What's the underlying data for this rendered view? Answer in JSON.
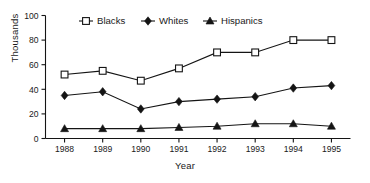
{
  "chart_data": {
    "type": "line",
    "title": "",
    "xlabel": "Year",
    "ylabel": "Thousands",
    "categories": [
      "1988",
      "1989",
      "1990",
      "1991",
      "1992",
      "1993",
      "1994",
      "1995"
    ],
    "x": [
      1988,
      1989,
      1990,
      1991,
      1992,
      1993,
      1994,
      1995
    ],
    "ylim": [
      0,
      100
    ],
    "yticks": [
      0,
      20,
      40,
      60,
      80,
      100
    ],
    "ytick_labels": [
      "0",
      "20",
      "40",
      "60",
      "80",
      "100"
    ],
    "grid": false,
    "legend_position": "top-center",
    "series": [
      {
        "name": "Blacks",
        "marker": "open-square",
        "color": "#141414",
        "values": [
          52,
          55,
          47,
          57,
          70,
          70,
          80,
          80
        ]
      },
      {
        "name": "Whites",
        "marker": "filled-diamond",
        "color": "#141414",
        "values": [
          35,
          38,
          24,
          30,
          32,
          34,
          41,
          43
        ]
      },
      {
        "name": "Hispanics",
        "marker": "filled-triangle",
        "color": "#141414",
        "values": [
          8,
          8,
          8,
          9,
          10,
          12,
          12,
          10
        ]
      }
    ]
  },
  "labels": {
    "y_axis_title": "Thousands",
    "x_axis_title": "Year"
  }
}
